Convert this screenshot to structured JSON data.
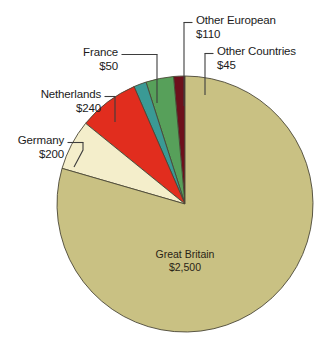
{
  "chart_data": {
    "type": "pie",
    "title": "",
    "subtitle": "",
    "xlabel": "",
    "ylabel": "",
    "legend_position": "none",
    "grid": false,
    "value_prefix": "$",
    "total": 3145,
    "categories": [
      "Great Britain",
      "Germany",
      "Netherlands",
      "France",
      "Other European",
      "Other Countries"
    ],
    "values": [
      2500,
      200,
      240,
      50,
      110,
      45
    ],
    "slices": [
      {
        "name": "Great Britain",
        "value": 2500,
        "value_label": "$2,500",
        "color": "#c9c183",
        "label_placement": "inside"
      },
      {
        "name": "Germany",
        "value": 200,
        "value_label": "$200",
        "color": "#f4eecb",
        "label_placement": "callout-left"
      },
      {
        "name": "Netherlands",
        "value": 240,
        "value_label": "$240",
        "color": "#e12d1e",
        "label_placement": "callout-left"
      },
      {
        "name": "France",
        "value": 50,
        "value_label": "$50",
        "color": "#3a9a95",
        "label_placement": "callout-left"
      },
      {
        "name": "Other European",
        "value": 110,
        "value_label": "$110",
        "color": "#57a05a",
        "label_placement": "callout-top"
      },
      {
        "name": "Other Countries",
        "value": 45,
        "value_label": "$45",
        "color": "#6d101c",
        "label_placement": "callout-top"
      }
    ],
    "colors": {
      "great_britain": "#c9c183",
      "germany": "#f4eecb",
      "netherlands": "#e12d1e",
      "france": "#3a9a95",
      "other_european": "#57a05a",
      "other_countries": "#6d101c",
      "outline": "#4a4636",
      "leader_line": "#3d3d3d",
      "text": "#1b1b1b",
      "background": "#ffffff"
    }
  },
  "callouts": {
    "other_european": {
      "name": "Other European",
      "value_label": "$110"
    },
    "other_countries": {
      "name": "Other Countries",
      "value_label": "$45"
    },
    "france": {
      "name": "France",
      "value_label": "$50"
    },
    "netherlands": {
      "name": "Netherlands",
      "value_label": "$240"
    },
    "germany": {
      "name": "Germany",
      "value_label": "$200"
    },
    "great_britain": {
      "name": "Great Britain",
      "value_label": "$2,500"
    }
  }
}
